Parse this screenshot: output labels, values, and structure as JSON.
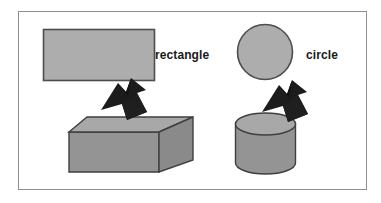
{
  "figure": {
    "background_color": "#ffffff",
    "border_color": "#8e8e8e",
    "palette": {
      "shape_fill": "#adadad",
      "shape_stroke": "#4d4d4d",
      "solid_top_fill": "#a8a8a8",
      "solid_front_fill": "#949494",
      "solid_side_fill": "#868686",
      "arrow_fill": "#1c1c1c",
      "arrow_shade": "#111111",
      "label_color": "#1a1a1a"
    },
    "pairs": [
      {
        "id": "rectangle-pair",
        "label": "rectangle",
        "flat_shape": "rectangle",
        "solid_shape": "rectangular-box",
        "arrow": "block-arrow-up"
      },
      {
        "id": "circle-pair",
        "label": "circle",
        "flat_shape": "circle",
        "solid_shape": "cylinder",
        "arrow": "block-arrow-up"
      }
    ]
  }
}
